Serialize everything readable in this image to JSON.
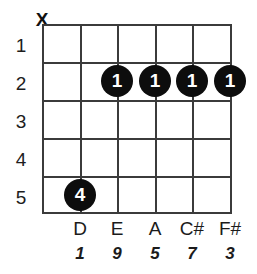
{
  "diagram": {
    "type": "guitar-chord-diagram",
    "instrument": "guitar",
    "string_count": 6,
    "fret_count": 5,
    "colors": {
      "background": "#ffffff",
      "grid": "#3b3b3b",
      "dot_fill": "#0d0d0d",
      "dot_text": "#ffffff",
      "label_text": "#1b1b1b"
    },
    "fret_numbers": [
      "1",
      "2",
      "3",
      "4",
      "5"
    ],
    "string_markers": [
      {
        "string": 1,
        "symbol": "X",
        "meaning": "muted"
      },
      {
        "string": 2,
        "symbol": "",
        "meaning": ""
      },
      {
        "string": 3,
        "symbol": "",
        "meaning": ""
      },
      {
        "string": 4,
        "symbol": "",
        "meaning": ""
      },
      {
        "string": 5,
        "symbol": "",
        "meaning": ""
      },
      {
        "string": 6,
        "symbol": "",
        "meaning": ""
      }
    ],
    "finger_dots": [
      {
        "string": 3,
        "fret": 2,
        "finger": "1"
      },
      {
        "string": 4,
        "fret": 2,
        "finger": "1"
      },
      {
        "string": 5,
        "fret": 2,
        "finger": "1"
      },
      {
        "string": 6,
        "fret": 2,
        "finger": "1"
      },
      {
        "string": 2,
        "fret": 5,
        "finger": "4"
      }
    ],
    "note_names": [
      {
        "string": 1,
        "name": ""
      },
      {
        "string": 2,
        "name": "D"
      },
      {
        "string": 3,
        "name": "E"
      },
      {
        "string": 4,
        "name": "A"
      },
      {
        "string": 5,
        "name": "C#"
      },
      {
        "string": 6,
        "name": "F#"
      }
    ],
    "intervals": [
      {
        "string": 1,
        "degree": ""
      },
      {
        "string": 2,
        "degree": "1"
      },
      {
        "string": 3,
        "degree": "9"
      },
      {
        "string": 4,
        "degree": "5"
      },
      {
        "string": 5,
        "degree": "7"
      },
      {
        "string": 6,
        "degree": "3"
      }
    ]
  }
}
